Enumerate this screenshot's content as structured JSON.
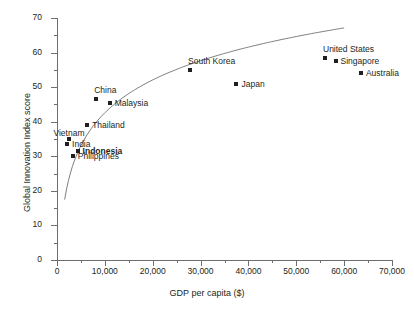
{
  "chart_data": {
    "type": "scatter",
    "title": "",
    "xlabel": "GDP per capita ($)",
    "ylabel": "Global Innovation Index score",
    "xlim": [
      0,
      70000
    ],
    "ylim": [
      0,
      70
    ],
    "xticks": [
      0,
      10000,
      20000,
      30000,
      40000,
      50000,
      60000,
      70000
    ],
    "xtick_labels": [
      "0",
      "10,000",
      "20,000",
      "30,000",
      "40,000",
      "50,000",
      "60,000",
      "70,000"
    ],
    "yticks": [
      0,
      10,
      20,
      30,
      40,
      50,
      60,
      70
    ],
    "ytick_labels": [
      "0",
      "10",
      "20",
      "30",
      "40",
      "50",
      "60",
      "70"
    ],
    "grid": false,
    "legend": false,
    "marker_color": "#231f20",
    "axis_color": "#6d6e71",
    "trendline": true,
    "points": [
      {
        "name": "India",
        "x": 2100,
        "y": 33.5,
        "label_pos": "right",
        "bold": false
      },
      {
        "name": "Vietnam",
        "x": 2600,
        "y": 35.0,
        "label_pos": "above-left",
        "bold": false
      },
      {
        "name": "Philippines",
        "x": 3300,
        "y": 30.0,
        "label_pos": "right",
        "bold": false
      },
      {
        "name": "Indonesia",
        "x": 4300,
        "y": 31.5,
        "label_pos": "right",
        "bold": true
      },
      {
        "name": "Thailand",
        "x": 6300,
        "y": 39.0,
        "label_pos": "right",
        "bold": false
      },
      {
        "name": "China",
        "x": 8200,
        "y": 46.5,
        "label_pos": "above",
        "bold": false
      },
      {
        "name": "Malaysia",
        "x": 11000,
        "y": 45.5,
        "label_pos": "right",
        "bold": false
      },
      {
        "name": "South Korea",
        "x": 27800,
        "y": 55.0,
        "label_pos": "above",
        "bold": false
      },
      {
        "name": "Japan",
        "x": 37500,
        "y": 51.0,
        "label_pos": "right",
        "bold": false
      },
      {
        "name": "United States",
        "x": 56000,
        "y": 58.5,
        "label_pos": "above",
        "bold": false
      },
      {
        "name": "Singapore",
        "x": 58200,
        "y": 57.5,
        "label_pos": "right",
        "bold": false
      },
      {
        "name": "Australia",
        "x": 63500,
        "y": 54.0,
        "label_pos": "right",
        "bold": false
      }
    ]
  }
}
